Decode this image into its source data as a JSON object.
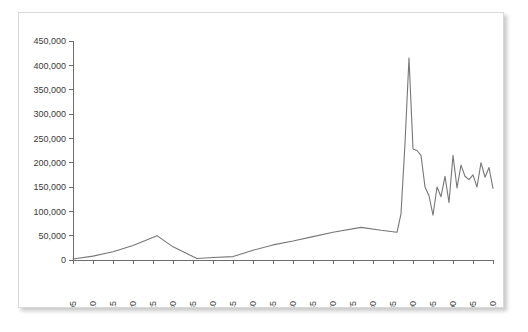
{
  "figure": {
    "frame_border_color": "#d9d9d9",
    "background_color": "#ffffff",
    "line_color": "#777777",
    "axis_color": "#6e6e6e",
    "label_color": "#3a3a3a"
  },
  "chart_data": {
    "type": "line",
    "title": "",
    "subtitle": "",
    "xlabel": "",
    "ylabel": "",
    "grid": false,
    "legend": null,
    "legend_position": "none",
    "xlim": [
      1905,
      2010
    ],
    "ylim": [
      0,
      450000
    ],
    "ytick_labels": [
      "450,000",
      "400,000",
      "350,000",
      "300,000",
      "250,000",
      "200,000",
      "150,000",
      "100,000",
      "50,000",
      "0"
    ],
    "ytick_values": [
      450000,
      400000,
      350000,
      300000,
      250000,
      200000,
      150000,
      100000,
      50000,
      0
    ],
    "xtick_labels": [
      "1905",
      "1910",
      "1915",
      "1920",
      "1925",
      "1930",
      "1935",
      "1940",
      "1945",
      "1950",
      "1955",
      "1960",
      "1965",
      "1970",
      "1975",
      "1980",
      "1985",
      "1990",
      "1995",
      "2000",
      "2005",
      "2010"
    ],
    "xtick_values": [
      1905,
      1910,
      1915,
      1920,
      1925,
      1930,
      1935,
      1940,
      1945,
      1950,
      1955,
      1960,
      1965,
      1970,
      1975,
      1980,
      1985,
      1990,
      1995,
      2000,
      2005,
      2010
    ],
    "xtick_rotation": -90,
    "series": [
      {
        "name": "series-1",
        "color": "#777777",
        "x": [
          1905,
          1910,
          1915,
          1920,
          1926,
          1930,
          1936,
          1940,
          1945,
          1950,
          1955,
          1960,
          1965,
          1970,
          1977,
          1982,
          1986,
          1987,
          1988,
          1989,
          1990,
          1991,
          1992,
          1993,
          1994,
          1995,
          1996,
          1997,
          1998,
          1999,
          2000,
          2001,
          2002,
          2003,
          2004,
          2005,
          2006,
          2007,
          2008,
          2009,
          2010
        ],
        "values": [
          2000,
          8000,
          17000,
          30000,
          50000,
          27000,
          3000,
          5000,
          7000,
          20000,
          31000,
          39000,
          48000,
          57000,
          67000,
          61000,
          57000,
          95000,
          240000,
          415000,
          228000,
          225000,
          215000,
          150000,
          132000,
          92000,
          150000,
          130000,
          172000,
          118000,
          215000,
          148000,
          195000,
          172000,
          165000,
          175000,
          150000,
          200000,
          170000,
          190000,
          147000
        ]
      }
    ]
  }
}
